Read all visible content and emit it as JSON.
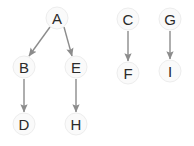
{
  "diagram": {
    "background_color": "#ffffff",
    "node_fill_color": "#fafafa",
    "node_stroke_color": "#ededed",
    "node_text_color": "#2b2b2b",
    "edge_color": "#8c8c8c",
    "node_radius": 11,
    "nodes": [
      {
        "id": "A",
        "label": "A",
        "cx": 57,
        "cy": 18
      },
      {
        "id": "B",
        "label": "B",
        "cx": 24,
        "cy": 67
      },
      {
        "id": "E",
        "label": "E",
        "cx": 76,
        "cy": 67
      },
      {
        "id": "D",
        "label": "D",
        "cx": 24,
        "cy": 124
      },
      {
        "id": "H",
        "label": "H",
        "cx": 76,
        "cy": 124
      },
      {
        "id": "C",
        "label": "C",
        "cx": 128,
        "cy": 19
      },
      {
        "id": "F",
        "label": "F",
        "cx": 128,
        "cy": 73
      },
      {
        "id": "G",
        "label": "G",
        "cx": 170,
        "cy": 19
      },
      {
        "id": "I",
        "label": "I",
        "cx": 170,
        "cy": 71
      }
    ],
    "edges": [
      {
        "id": "A-B",
        "from": "A",
        "to": "B",
        "x1": 50,
        "y1": 27,
        "x2": 29,
        "y2": 56
      },
      {
        "id": "A-E",
        "from": "A",
        "to": "E",
        "x1": 64,
        "y1": 27,
        "x2": 72,
        "y2": 56
      },
      {
        "id": "B-D",
        "from": "B",
        "to": "D",
        "x1": 24,
        "y1": 79,
        "x2": 24,
        "y2": 112
      },
      {
        "id": "E-H",
        "from": "E",
        "to": "H",
        "x1": 76,
        "y1": 79,
        "x2": 76,
        "y2": 112
      },
      {
        "id": "C-F",
        "from": "C",
        "to": "F",
        "x1": 128,
        "y1": 31,
        "x2": 128,
        "y2": 61
      },
      {
        "id": "G-I",
        "from": "G",
        "to": "I",
        "x1": 170,
        "y1": 31,
        "x2": 170,
        "y2": 59
      }
    ],
    "components": [
      {
        "name": "component-1",
        "members": [
          "A",
          "B",
          "E",
          "D",
          "H"
        ]
      },
      {
        "name": "component-2",
        "members": [
          "C",
          "F"
        ]
      },
      {
        "name": "component-3",
        "members": [
          "G",
          "I"
        ]
      }
    ]
  }
}
